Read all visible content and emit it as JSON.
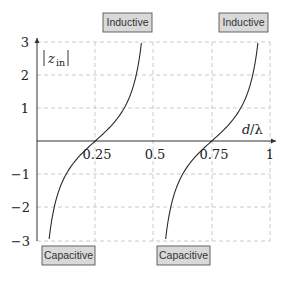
{
  "chart_data": {
    "type": "line",
    "title": "",
    "xlabel": "d/λ",
    "ylabel": "|z_in|",
    "xlim": [
      0,
      1
    ],
    "ylim": [
      -3,
      3
    ],
    "grid": true,
    "x_ticks": [
      "0.25",
      "0.5",
      "0.75",
      "1"
    ],
    "y_ticks": [
      "3",
      "2",
      "1",
      "−1",
      "−2",
      "−3"
    ],
    "function": "-cot(2π d/λ)",
    "series": [
      {
        "name": "branch-1",
        "x": [
          0.052,
          0.06,
          0.08,
          0.1,
          0.125,
          0.15,
          0.175,
          0.2,
          0.225,
          0.25,
          0.275,
          0.3,
          0.325,
          0.35,
          0.375,
          0.4,
          0.425,
          0.44,
          0.448
        ],
        "y": [
          -3.0,
          -2.56,
          -1.84,
          -1.38,
          -1.0,
          -0.73,
          -0.51,
          -0.32,
          -0.16,
          0.0,
          0.16,
          0.32,
          0.51,
          0.73,
          1.0,
          1.38,
          1.96,
          2.56,
          3.0
        ]
      },
      {
        "name": "branch-2",
        "x": [
          0.552,
          0.56,
          0.58,
          0.6,
          0.625,
          0.65,
          0.675,
          0.7,
          0.725,
          0.75,
          0.775,
          0.8,
          0.825,
          0.85,
          0.875,
          0.9,
          0.925,
          0.94,
          0.948
        ],
        "y": [
          -3.0,
          -2.56,
          -1.84,
          -1.38,
          -1.0,
          -0.73,
          -0.51,
          -0.32,
          -0.16,
          0.0,
          0.16,
          0.32,
          0.51,
          0.73,
          1.0,
          1.38,
          1.96,
          2.56,
          3.0
        ]
      }
    ],
    "annotations": [
      {
        "text": "Inductive",
        "x": 0.4,
        "y": 3.4
      },
      {
        "text": "Inductive",
        "x": 0.9,
        "y": 3.4
      },
      {
        "text": "Capacitive",
        "x": 0.1,
        "y": -3.5
      },
      {
        "text": "Capacitive",
        "x": 0.6,
        "y": -3.5
      }
    ]
  },
  "labels": {
    "xlabel_d": "d",
    "xlabel_lambda": "/λ",
    "ylabel_z": "z",
    "ylabel_sub": "in",
    "inductive_1": "Inductive",
    "inductive_2": "Inductive",
    "capacitive_1": "Capacitive",
    "capacitive_2": "Capacitive",
    "xtick_025": "0.25",
    "xtick_05": "0.5",
    "xtick_075": "0.75",
    "xtick_1": "1",
    "ytick_3": "3",
    "ytick_2": "2",
    "ytick_1": "1",
    "ytick_m1": "−1",
    "ytick_m2": "−2",
    "ytick_m3": "−3"
  },
  "colors": {
    "curve": "#2a2a2a",
    "axis": "#333333",
    "grid": "#bdbdbd",
    "box_fill": "#d9d9d9",
    "box_stroke": "#555555"
  }
}
